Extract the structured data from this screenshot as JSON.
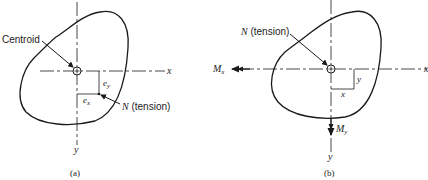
{
  "figure_a": {
    "caption": "(a)",
    "centroid_label": "Centroid",
    "force_label": "N (tension)",
    "force_symbol": "N",
    "force_desc": "(tension)",
    "axis_x": "x",
    "axis_y": "y",
    "ecc_x_base": "e",
    "ecc_x_sub": "x",
    "ecc_y_base": "e",
    "ecc_y_sub": "y"
  },
  "figure_b": {
    "caption": "(b)",
    "force_symbol": "N",
    "force_desc": "(tension)",
    "axis_x": "x",
    "axis_y": "y",
    "moment_x_base": "M",
    "moment_x_sub": "x",
    "moment_y_base": "M",
    "moment_y_sub": "y",
    "dim_x": "x",
    "dim_y": "y"
  },
  "colors": {
    "line": "#1a1a1a",
    "background": "#ffffff"
  }
}
